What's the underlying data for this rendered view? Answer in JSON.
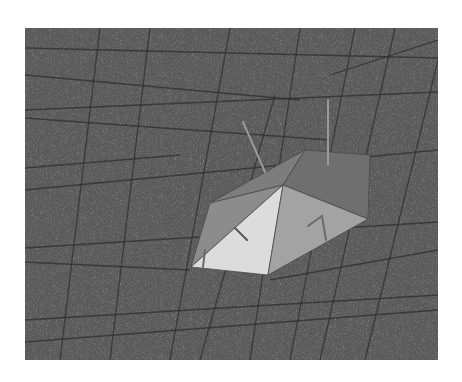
{
  "figure": {
    "background_color": "#ffffff",
    "panel": {
      "x": 25,
      "y": 28,
      "width": 413,
      "height": 332,
      "fill": "#5b5b5b"
    },
    "grid_color": "#2e2e2e",
    "grid_lines": [
      [
        25,
        48,
        438,
        58
      ],
      [
        25,
        110,
        438,
        92
      ],
      [
        25,
        118,
        330,
        140
      ],
      [
        25,
        168,
        180,
        155
      ],
      [
        25,
        190,
        438,
        150
      ],
      [
        25,
        248,
        438,
        222
      ],
      [
        25,
        262,
        190,
        270
      ],
      [
        25,
        320,
        438,
        295
      ],
      [
        25,
        342,
        438,
        310
      ],
      [
        270,
        280,
        438,
        250
      ],
      [
        100,
        28,
        60,
        360
      ],
      [
        150,
        28,
        110,
        360
      ],
      [
        230,
        28,
        170,
        360
      ],
      [
        275,
        95,
        200,
        360
      ],
      [
        300,
        28,
        250,
        360
      ],
      [
        355,
        28,
        290,
        360
      ],
      [
        395,
        28,
        320,
        360
      ],
      [
        438,
        60,
        365,
        360
      ],
      [
        25,
        75,
        300,
        100
      ],
      [
        330,
        75,
        438,
        40
      ]
    ],
    "polyhedron": {
      "faces": [
        {
          "name": "back-translucent-left",
          "points": "210,203 305,150 283,185",
          "fill": "#7d7d7d"
        },
        {
          "name": "back-translucent-right",
          "points": "283,185 305,150 370,155 368,219",
          "fill": "#6f6f6f"
        },
        {
          "name": "left-side",
          "points": "191,267 210,203 283,185",
          "fill": "#8c8c8c"
        },
        {
          "name": "front-lit",
          "points": "191,267 283,185 268,275",
          "fill": "#dcdcdc"
        },
        {
          "name": "right-side",
          "points": "283,185 368,219 268,275",
          "fill": "#a3a3a3"
        }
      ],
      "edge_color": "#4a4a4a"
    },
    "sticks": [
      {
        "name": "normal-left",
        "x1": 243,
        "y1": 122,
        "x2": 265,
        "y2": 172,
        "color": "#9a9a9a"
      },
      {
        "name": "normal-right",
        "x1": 328,
        "y1": 100,
        "x2": 328,
        "y2": 165,
        "color": "#9a9a9a"
      },
      {
        "name": "inner-stroke-1",
        "x1": 235,
        "y1": 228,
        "x2": 247,
        "y2": 240,
        "color": "#555555"
      },
      {
        "name": "inner-stroke-2",
        "x1": 308,
        "y1": 226,
        "x2": 322,
        "y2": 216,
        "color": "#6a6a6a"
      },
      {
        "name": "inner-stroke-3",
        "x1": 322,
        "y1": 216,
        "x2": 326,
        "y2": 240,
        "color": "#6a6a6a"
      },
      {
        "name": "inner-stroke-4",
        "x1": 205,
        "y1": 250,
        "x2": 203,
        "y2": 267,
        "color": "#6a6a6a"
      }
    ]
  }
}
